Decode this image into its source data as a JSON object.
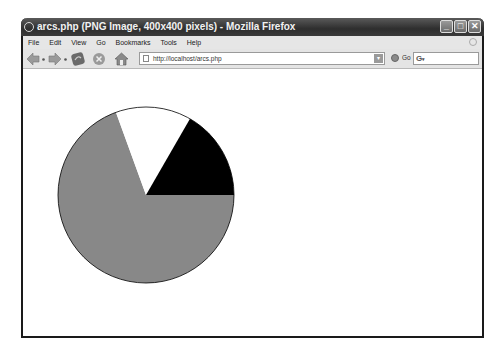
{
  "window": {
    "title": "arcs.php (PNG Image, 400x400 pixels) - Mozilla Firefox",
    "controls": {
      "minimize": "_",
      "maximize": "□",
      "close": "✕"
    }
  },
  "menubar": {
    "items": [
      "File",
      "Edit",
      "View",
      "Go",
      "Bookmarks",
      "Tools",
      "Help"
    ]
  },
  "toolbar": {
    "icons": [
      "back-icon",
      "forward-icon",
      "reload-icon",
      "stop-icon",
      "home-icon"
    ],
    "url": "http://localhost/arcs.php",
    "go_label": "Go",
    "search_placeholder": ""
  },
  "content": {
    "image_description": "Pie chart rendered with PHP GD imagefilledarc",
    "pie": {
      "cx": 123,
      "cy": 126,
      "r": 88,
      "slices": [
        {
          "name": "gray-slice",
          "start": 0,
          "end": 250,
          "color": "#888888"
        },
        {
          "name": "white-slice",
          "start": 250,
          "end": 300,
          "color": "#ffffff"
        },
        {
          "name": "black-slice",
          "start": 300,
          "end": 360,
          "color": "#000000"
        }
      ],
      "outline": "#000000"
    }
  },
  "chart_data": {
    "type": "pie",
    "title": "",
    "categories": [
      "gray",
      "white",
      "black"
    ],
    "values": [
      250,
      50,
      60
    ],
    "unit": "degrees",
    "colors": [
      "#888888",
      "#ffffff",
      "#000000"
    ]
  }
}
